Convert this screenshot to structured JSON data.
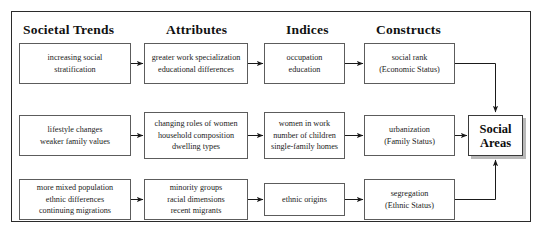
{
  "diagram": {
    "title_columns": [
      {
        "label": "Societal Trends"
      },
      {
        "label": "Attributes"
      },
      {
        "label": "Indices"
      },
      {
        "label": "Constructs"
      }
    ],
    "rows": [
      {
        "id": "economic",
        "trend": [
          "increasing social",
          "stratification"
        ],
        "attributes": [
          "greater work specialization",
          "educational differences"
        ],
        "indices": [
          "occupation",
          "education"
        ],
        "construct": [
          "social rank",
          "(Economic Status)"
        ]
      },
      {
        "id": "family",
        "trend": [
          "lifestyle changes",
          "weaker family values"
        ],
        "attributes": [
          "changing roles of women",
          "household composition",
          "dwelling types"
        ],
        "indices": [
          "women in work",
          "number of children",
          "single-family homes"
        ],
        "construct": [
          "urbanization",
          "(Family Status)"
        ]
      },
      {
        "id": "ethnic",
        "trend": [
          "more mixed population",
          "ethnic differences",
          "continuing migrations"
        ],
        "attributes": [
          "minority groups",
          "racial dimensions",
          "recent migrants"
        ],
        "indices": [
          "ethnic origins"
        ],
        "construct": [
          "segregation",
          "(Ethnic Status)"
        ]
      }
    ],
    "outcome": {
      "lines": [
        "Social",
        "Areas"
      ]
    },
    "colors": {
      "frame": "#2b2b2b",
      "box_border": "#5c5c5c",
      "arrow": "#1a1a1a",
      "shadow": "#b9b9b9",
      "text": "#1c1c1c"
    }
  }
}
